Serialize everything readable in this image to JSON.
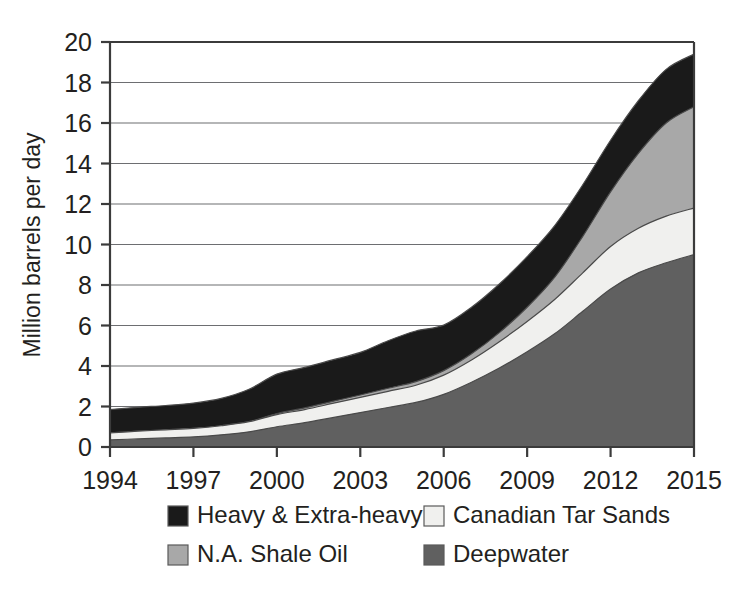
{
  "chart_data": {
    "type": "area",
    "stacked": true,
    "title": "",
    "subtitle": "",
    "xlabel": "",
    "ylabel": "Million barrels per day",
    "xlim": [
      1994,
      2015
    ],
    "ylim": [
      0,
      20
    ],
    "ytick_step": 2,
    "grid": true,
    "legend_position": "bottom",
    "x": [
      1994,
      1995,
      1996,
      1997,
      1998,
      1999,
      2000,
      2001,
      2002,
      2003,
      2004,
      2005,
      2006,
      2007,
      2008,
      2009,
      2010,
      2011,
      2012,
      2013,
      2014,
      2015
    ],
    "xticks": [
      1994,
      1997,
      2000,
      2003,
      2006,
      2009,
      2012,
      2015
    ],
    "xtick_labels": [
      "1994",
      "1997",
      "2000",
      "2003",
      "2006",
      "2009",
      "2012",
      "2015"
    ],
    "yticks": [
      0,
      2,
      4,
      6,
      8,
      10,
      12,
      14,
      16,
      18,
      20
    ],
    "ytick_labels": [
      "0",
      "2",
      "4",
      "6",
      "8",
      "10",
      "12",
      "14",
      "16",
      "18",
      "20"
    ],
    "stack_order_bottom_to_top": [
      "Deepwater",
      "Canadian Tar Sands",
      "N.A. Shale Oil",
      "Heavy & Extra-heavy"
    ],
    "series": [
      {
        "name": "Deepwater",
        "color": "#606060",
        "values": [
          0.35,
          0.4,
          0.45,
          0.5,
          0.6,
          0.75,
          1.0,
          1.2,
          1.45,
          1.7,
          1.95,
          2.2,
          2.6,
          3.2,
          3.9,
          4.7,
          5.6,
          6.7,
          7.8,
          8.6,
          9.1,
          9.5
        ]
      },
      {
        "name": "Canadian Tar Sands",
        "color": "#f0f0ee",
        "values": [
          0.35,
          0.38,
          0.4,
          0.42,
          0.45,
          0.5,
          0.6,
          0.65,
          0.7,
          0.75,
          0.8,
          0.85,
          0.95,
          1.1,
          1.3,
          1.5,
          1.7,
          1.9,
          2.1,
          2.2,
          2.3,
          2.3
        ]
      },
      {
        "name": "N.A. Shale Oil",
        "color": "#a8a8a8",
        "values": [
          0.0,
          0.0,
          0.0,
          0.0,
          0.0,
          0.0,
          0.05,
          0.08,
          0.1,
          0.12,
          0.15,
          0.18,
          0.22,
          0.3,
          0.45,
          0.7,
          1.1,
          1.8,
          2.7,
          3.7,
          4.6,
          5.0
        ]
      },
      {
        "name": "Heavy & Extra-heavy",
        "color": "#1a1a1a",
        "values": [
          1.15,
          1.18,
          1.2,
          1.25,
          1.35,
          1.6,
          1.95,
          2.0,
          2.05,
          2.1,
          2.35,
          2.5,
          2.25,
          2.3,
          2.4,
          2.5,
          2.55,
          2.55,
          2.55,
          2.6,
          2.65,
          2.6
        ]
      }
    ],
    "stack_tops": {
      "Deepwater": [
        0.35,
        0.4,
        0.45,
        0.5,
        0.6,
        0.75,
        1.0,
        1.2,
        1.45,
        1.7,
        1.95,
        2.2,
        2.6,
        3.2,
        3.9,
        4.7,
        5.6,
        6.7,
        7.8,
        8.6,
        9.1,
        9.5
      ],
      "Canadian Tar Sands": [
        0.7,
        0.78,
        0.85,
        0.92,
        1.05,
        1.25,
        1.6,
        1.85,
        2.15,
        2.45,
        2.75,
        3.05,
        3.55,
        4.3,
        5.2,
        6.2,
        7.3,
        8.6,
        9.9,
        10.8,
        11.4,
        11.8
      ],
      "N.A. Shale Oil": [
        0.7,
        0.78,
        0.85,
        0.92,
        1.05,
        1.25,
        1.65,
        1.93,
        2.25,
        2.57,
        2.9,
        3.23,
        3.77,
        4.6,
        5.65,
        6.9,
        8.4,
        10.4,
        12.6,
        14.5,
        16.0,
        16.8
      ],
      "Heavy & Extra-heavy": [
        1.85,
        1.96,
        2.05,
        2.17,
        2.4,
        2.85,
        3.6,
        3.93,
        4.3,
        4.67,
        5.25,
        5.73,
        6.02,
        6.9,
        8.05,
        9.4,
        10.95,
        12.95,
        15.15,
        17.1,
        18.65,
        19.4
      ]
    },
    "legend": [
      {
        "label": "Heavy & Extra-heavy",
        "color": "#1a1a1a"
      },
      {
        "label": "Canadian Tar Sands",
        "color": "#f0f0ee"
      },
      {
        "label": "N.A. Shale Oil",
        "color": "#a8a8a8"
      },
      {
        "label": "Deepwater",
        "color": "#606060"
      }
    ]
  }
}
